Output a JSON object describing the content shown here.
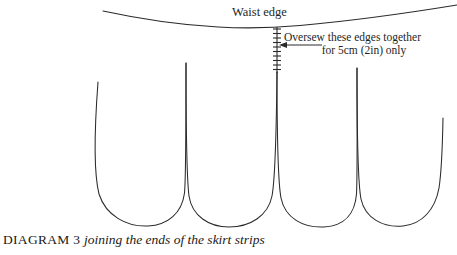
{
  "diagram": {
    "caption_title": "DIAGRAM 3",
    "caption_description": "joining the ends of the skirt strips",
    "labels": {
      "waist_edge": "Waist edge",
      "oversew_line1": "Oversew these edges together",
      "oversew_line2": "for 5cm (2in) only"
    },
    "colors": {
      "line": "#2a2a2a",
      "text": "#1f1f1f",
      "background": "#ffffff"
    },
    "measurements": {
      "seam_length_metric": "5cm",
      "seam_length_imperial": "2in"
    },
    "shapes": {
      "waist_edge_curve": "M103,11 C160,22 210,27 260,27 C320,27 400,18 457,6",
      "skirt_loops": "M98,82 C96,130 95,178 103,200 C112,223 142,228 166,219 C182,212 186,188 186,63 C186,188 192,213 208,220 C232,230 262,226 271,204 C277,188 277,130 277,72 C277,130 277,190 284,207 C294,229 326,232 346,220 C356,213 357,180 357,68 C357,180 358,206 366,216 C376,228 402,230 418,220 C432,211 441,185 443,118",
      "stitch_line": "M277,28 L277,72"
    }
  }
}
